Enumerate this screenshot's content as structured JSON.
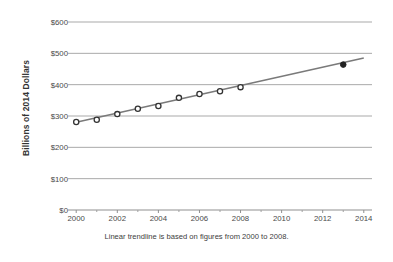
{
  "chart_data": {
    "type": "scatter",
    "title": "",
    "subtitle": "",
    "xlabel": "",
    "ylabel": "Billions of 2014 Dollars",
    "caption": "Linear trendline is based on figures from 2000 to 2008.",
    "xlim": [
      1999.6,
      2014.4
    ],
    "ylim": [
      0,
      600
    ],
    "grid": "horizontal",
    "legend": "none",
    "y_ticks": [
      "$0",
      "$100",
      "$200",
      "$300",
      "$400",
      "$500",
      "$600"
    ],
    "y_tick_values": [
      0,
      100,
      200,
      300,
      400,
      500,
      600
    ],
    "x_ticks": [
      "2000",
      "2002",
      "2004",
      "2006",
      "2008",
      "2010",
      "2012",
      "2014"
    ],
    "x_tick_values": [
      2000,
      2002,
      2004,
      2006,
      2008,
      2010,
      2012,
      2014
    ],
    "x_minor_tick_values": [
      2001,
      2003,
      2005,
      2007,
      2009,
      2011,
      2013
    ],
    "series": [
      {
        "name": "Observed (2000-2008)",
        "marker": "open-circle",
        "color": "#333333",
        "fill": "#ffffff",
        "x": [
          2000,
          2001,
          2002,
          2003,
          2004,
          2005,
          2006,
          2007,
          2008
        ],
        "values": [
          281,
          288,
          306,
          323,
          332,
          358,
          370,
          379,
          392
        ]
      },
      {
        "name": "Observed (2013)",
        "marker": "filled-circle",
        "color": "#222222",
        "fill": "#222222",
        "x": [
          2013
        ],
        "values": [
          464
        ]
      },
      {
        "name": "Linear trendline",
        "type": "line",
        "color": "#7a7a7a",
        "x": [
          2000,
          2014
        ],
        "values": [
          280,
          485
        ]
      }
    ]
  },
  "axis": {
    "y_title": "Billions of 2014 Dollars"
  }
}
